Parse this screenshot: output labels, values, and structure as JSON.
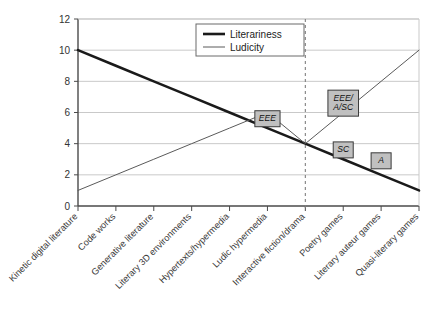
{
  "chart_data": {
    "type": "line",
    "title": "",
    "xlabel": "",
    "ylabel": "",
    "ylim": [
      0,
      12
    ],
    "yticks": [
      0,
      2,
      4,
      6,
      8,
      10,
      12
    ],
    "grid": true,
    "legend_position": "top-center",
    "categories": [
      "Kinetic digital literature",
      "Code works",
      "Generative literature",
      "Literary 3D environments",
      "Hypertexts/hypermedia",
      "Ludic hypermedia",
      "Interactive fiction/drama",
      "Poetry games",
      "Literary auteur games",
      "Quasi-literary games"
    ],
    "series": [
      {
        "name": "Literariness",
        "color": "#1a1a1a",
        "width": 2.6,
        "values": [
          10,
          9,
          8,
          7,
          6,
          5,
          4,
          3,
          2,
          1
        ]
      },
      {
        "name": "Ludicity",
        "color": "#5a5a5a",
        "width": 1.0,
        "values": [
          1,
          2,
          3,
          4,
          5,
          6,
          4,
          6,
          8,
          10
        ]
      }
    ],
    "divider": {
      "label": "category-divider",
      "at_category_index": 6,
      "style": "dashed",
      "color": "#808080"
    },
    "annotations": [
      {
        "id": "eee",
        "text": "EEE",
        "lines": [
          "EEE"
        ],
        "x_index": 5,
        "y_value": 5.6
      },
      {
        "id": "eee-a-sc",
        "text": "EEE/ A/SC",
        "lines": [
          "EEE/",
          "A/SC"
        ],
        "x_index": 7,
        "y_value": 6.6
      },
      {
        "id": "sc",
        "text": "SC",
        "lines": [
          "SC"
        ],
        "x_index": 7,
        "y_value": 3.6
      },
      {
        "id": "a",
        "text": "A",
        "lines": [
          "A"
        ],
        "x_index": 8,
        "y_value": 2.9
      }
    ]
  },
  "legend": {
    "entries": [
      {
        "label": "Literariness"
      },
      {
        "label": "Ludicity"
      }
    ]
  },
  "axis": {
    "y_tick_labels": [
      "0",
      "2",
      "4",
      "6",
      "8",
      "10",
      "12"
    ]
  },
  "colors": {
    "literariness": "#1a1a1a",
    "ludicity": "#5a5a5a",
    "gridline": "#c9c9c9",
    "axis": "#4a4a4a",
    "annotation_fill": "#c0c0c0",
    "annotation_border": "#3a3a3a",
    "divider": "#808080",
    "background": "#ffffff"
  }
}
